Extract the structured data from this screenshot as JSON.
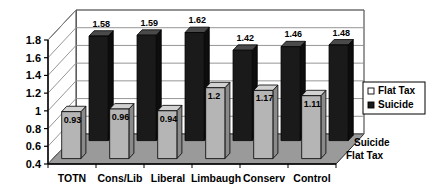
{
  "chart_data": {
    "type": "bar",
    "title": "",
    "xlabel": "",
    "ylabel": "",
    "ylim": [
      0.4,
      1.8
    ],
    "yticks": [
      "0.4",
      "0.6",
      "0.8",
      "1",
      "1.2",
      "1.4",
      "1.6",
      "1.8"
    ],
    "grid": true,
    "legend_position": "right",
    "projection": "3d",
    "categories": [
      "TOTN",
      "Cons/Lib",
      "Liberal",
      "Limbaugh",
      "Conserv",
      "Control"
    ],
    "series": [
      {
        "name": "Flat Tax",
        "values": [
          0.93,
          0.96,
          0.94,
          1.2,
          1.17,
          1.11
        ],
        "labels": [
          "0.93",
          "0.96",
          "0.94",
          "1.2",
          "1.17",
          "1.11"
        ],
        "color": "#b5b5b5"
      },
      {
        "name": "Suicide",
        "values": [
          1.58,
          1.59,
          1.62,
          1.42,
          1.46,
          1.48
        ],
        "labels": [
          "1.58",
          "1.59",
          "1.62",
          "1.42",
          "1.46",
          "1.48"
        ],
        "color": "#1a1a1a"
      }
    ],
    "depth_axis_labels": [
      "Suicide",
      "Flat Tax"
    ]
  },
  "legend": {
    "entries": [
      {
        "label": "Flat Tax",
        "swatch_icon": "legend-swatch-light"
      },
      {
        "label": "Suicide",
        "swatch_icon": "legend-swatch-dark"
      }
    ]
  },
  "colors": {
    "flat_tax_front": "#b5b5b5",
    "flat_tax_top": "#d2d2d2",
    "flat_tax_side": "#8a8a8a",
    "suicide_front": "#1a1a1a",
    "suicide_top": "#4a4a4a",
    "suicide_side": "#0d0d0d",
    "wall": "#ffffff",
    "floor": "#9a9a9a",
    "axis_line": "#000000",
    "grid_line": "#8a8a8a"
  }
}
